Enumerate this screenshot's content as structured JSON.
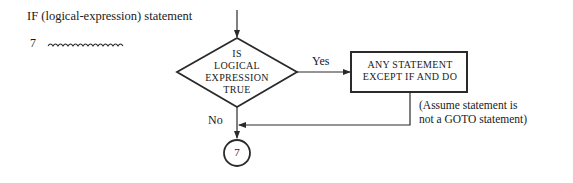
{
  "header": {
    "syntax": "IF (logical-expression) statement",
    "label": "7"
  },
  "flowchart": {
    "decision": {
      "lines": [
        "IS",
        "LOGICAL",
        "EXPRESSION",
        "TRUE"
      ]
    },
    "process": {
      "lines": [
        "ANY STATEMENT",
        "EXCEPT IF AND DO"
      ]
    },
    "yes_label": "Yes",
    "no_label": "No",
    "connector_label": "7",
    "note": {
      "lines": [
        "(Assume statement is",
        "not a GOTO statement)"
      ]
    }
  },
  "colors": {
    "stroke": "#2a2a2a",
    "text": "#1a1a1a",
    "background": "#ffffff"
  }
}
